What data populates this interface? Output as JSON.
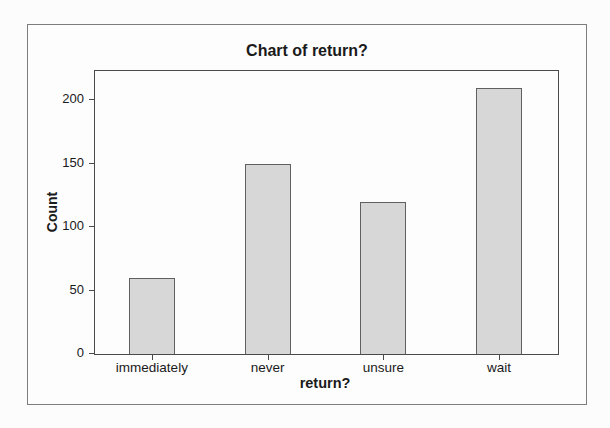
{
  "chart_data": {
    "type": "bar",
    "title": "Chart of return?",
    "categories": [
      "immediately",
      "never",
      "unsure",
      "wait"
    ],
    "values": [
      60,
      150,
      120,
      210
    ],
    "xlabel": "return?",
    "ylabel": "Count",
    "ylim": [
      0,
      223
    ],
    "yticks": [
      0,
      50,
      100,
      150,
      200
    ],
    "grid": false,
    "legend_position": "none",
    "colors": {
      "bar_fill": "#d7d7d7",
      "bar_border": "#606060",
      "axis": "#4a4a4a",
      "frame_border": "#7d7d7d",
      "text": "#1a1a1a",
      "background": "#fdfdfd"
    }
  }
}
